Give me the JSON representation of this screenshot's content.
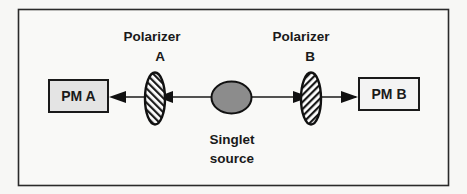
{
  "diagram": {
    "type": "optical-setup",
    "frame": {
      "stroke": "#2a2a2a"
    },
    "detector_a": {
      "label": "PM A",
      "fill": "#e4e4e4"
    },
    "detector_b": {
      "label": "PM B",
      "fill": "#f3f3f3"
    },
    "polarizer_a": {
      "title": "Polarizer",
      "letter": "A",
      "hatch": "forward-slash"
    },
    "polarizer_b": {
      "title": "Polarizer",
      "letter": "B",
      "hatch": "back-slash"
    },
    "source": {
      "line1": "Singlet",
      "line2": "source",
      "fill": "#8c8c8c"
    },
    "beams": [
      {
        "from": "source",
        "to": "PM A",
        "direction": "left"
      },
      {
        "from": "source",
        "to": "PM B",
        "direction": "right"
      }
    ]
  }
}
